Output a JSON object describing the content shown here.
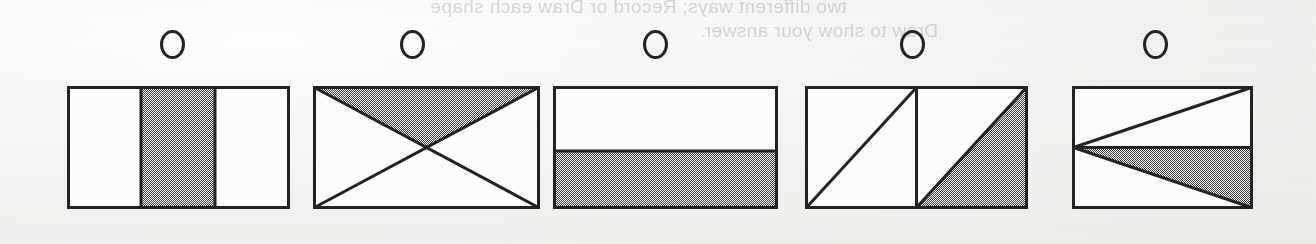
{
  "page": {
    "width": 1316,
    "height": 244,
    "paper_color": "#f6f5f3",
    "ink_color": "#232323",
    "shade_color": "#9a9a9a"
  },
  "bleed_through_text": {
    "line_1": "two different ways; Record or Draw each shape",
    "line_2": "Draw to show your answer."
  },
  "answer_bubbles": [
    {
      "id": "A",
      "label": "",
      "cx": 172,
      "cy": 44,
      "selected": false
    },
    {
      "id": "B",
      "label": "",
      "cx": 412,
      "cy": 44,
      "selected": false
    },
    {
      "id": "C",
      "label": "",
      "cx": 655,
      "cy": 44,
      "selected": false
    },
    {
      "id": "D",
      "label": "",
      "cx": 912,
      "cy": 44,
      "selected": false
    },
    {
      "id": "E",
      "label": "",
      "cx": 1155,
      "cy": 44,
      "selected": false
    }
  ],
  "shapes": [
    {
      "id": "shape-1",
      "name": "rectangle-thirds-middle-shaded",
      "description": "Rectangle divided into three equal vertical strips with the middle strip shaded",
      "x": 67,
      "y": 86,
      "width": 223,
      "height": 123,
      "parts_total": 3,
      "parts_shaded": 1,
      "fraction": "1/3"
    },
    {
      "id": "shape-2",
      "name": "rectangle-both-diagonals-top-triangle-shaded",
      "description": "Rectangle with both diagonals drawn forming four triangles; top triangle shaded",
      "x": 313,
      "y": 86,
      "width": 227,
      "height": 123,
      "parts_total": 4,
      "parts_shaded": 1,
      "fraction": "1/4"
    },
    {
      "id": "shape-3",
      "name": "rectangle-halves-bottom-shaded",
      "description": "Rectangle divided by a horizontal line with the bottom half shaded",
      "x": 553,
      "y": 86,
      "width": 225,
      "height": 123,
      "parts_total": 2,
      "parts_shaded": 1,
      "fraction": "1/2"
    },
    {
      "id": "shape-4",
      "name": "two-squares-diagonals-one-triangle-shaded",
      "description": "Two squares side by side, each cut by a diagonal; lower-right triangle of the right square shaded",
      "x": 805,
      "y": 86,
      "width": 223,
      "height": 123,
      "parts_total": 4,
      "parts_shaded": 1,
      "fraction": "1/4"
    },
    {
      "id": "shape-5",
      "name": "rectangle-fan-from-left-midpoint-one-shaded",
      "description": "Rectangle with lines from the left midpoint to the top-right and bottom-right corners plus a horizontal midline; the triangle below the midline is shaded",
      "x": 1072,
      "y": 86,
      "width": 181,
      "height": 123,
      "parts_total": 4,
      "parts_shaded": 1,
      "fraction": "1/4"
    }
  ]
}
